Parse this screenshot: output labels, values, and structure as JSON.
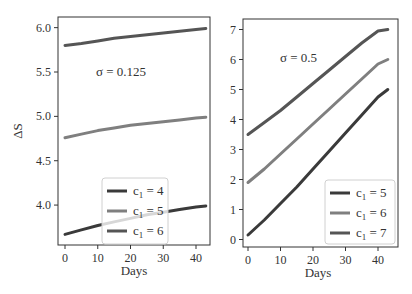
{
  "chart_data": [
    {
      "type": "line",
      "title": "",
      "annotation": "σ = 0.125",
      "xlabel": "Days",
      "ylabel": "ΔS",
      "xlim": [
        -2,
        45
      ],
      "ylim": [
        3.55,
        6.12
      ],
      "xticks": [
        0,
        10,
        20,
        30,
        40
      ],
      "yticks": [
        4.0,
        4.5,
        5.0,
        5.5,
        6.0
      ],
      "ytick_labels": [
        "4.0",
        "4.5",
        "5.0",
        "5.5",
        "6.0"
      ],
      "legend_position": "lower right",
      "x": [
        0,
        5,
        10,
        15,
        20,
        25,
        30,
        35,
        40,
        43
      ],
      "series": [
        {
          "name": "c1 = 4",
          "color": "#3a3a3a",
          "values": [
            3.67,
            3.72,
            3.77,
            3.81,
            3.85,
            3.89,
            3.92,
            3.95,
            3.98,
            3.99
          ]
        },
        {
          "name": "c1 = 5",
          "color": "#7f7f7f",
          "values": [
            4.76,
            4.8,
            4.84,
            4.87,
            4.9,
            4.92,
            4.94,
            4.96,
            4.98,
            4.99
          ]
        },
        {
          "name": "c1 = 6",
          "color": "#555555",
          "values": [
            5.8,
            5.82,
            5.85,
            5.88,
            5.9,
            5.92,
            5.94,
            5.96,
            5.98,
            5.99
          ]
        }
      ]
    },
    {
      "type": "line",
      "title": "",
      "annotation": "σ = 0.5",
      "xlabel": "Days",
      "ylabel": "",
      "xlim": [
        -2,
        46
      ],
      "ylim": [
        -0.25,
        7.35
      ],
      "xticks": [
        0,
        10,
        20,
        30,
        40
      ],
      "yticks": [
        0,
        1,
        2,
        3,
        4,
        5,
        6,
        7
      ],
      "ytick_labels": [
        "0",
        "1",
        "2",
        "3",
        "4",
        "5",
        "6",
        "7"
      ],
      "legend_position": "lower right",
      "x": [
        0,
        5,
        10,
        15,
        20,
        25,
        30,
        35,
        40,
        43
      ],
      "series": [
        {
          "name": "c1 = 5",
          "color": "#3a3a3a",
          "values": [
            0.15,
            0.65,
            1.2,
            1.75,
            2.35,
            2.95,
            3.55,
            4.15,
            4.75,
            5.0
          ]
        },
        {
          "name": "c1 = 6",
          "color": "#7f7f7f",
          "values": [
            1.9,
            2.35,
            2.85,
            3.35,
            3.85,
            4.35,
            4.85,
            5.35,
            5.85,
            6.0
          ]
        },
        {
          "name": "c1 = 7",
          "color": "#555555",
          "values": [
            3.5,
            3.9,
            4.3,
            4.75,
            5.2,
            5.65,
            6.1,
            6.55,
            6.95,
            7.0
          ]
        }
      ]
    }
  ],
  "panels": [
    {
      "annotation": "σ = 0.125",
      "xlabel": "Days",
      "ylabel": "ΔS",
      "legend": [
        "c",
        "c",
        "c"
      ],
      "legend_sub": "1",
      "legend_vals": [
        "= 4",
        "= 5",
        "= 6"
      ]
    },
    {
      "annotation": "σ = 0.5",
      "xlabel": "Days",
      "legend_vals": [
        "= 5",
        "= 6",
        "= 7"
      ]
    }
  ]
}
